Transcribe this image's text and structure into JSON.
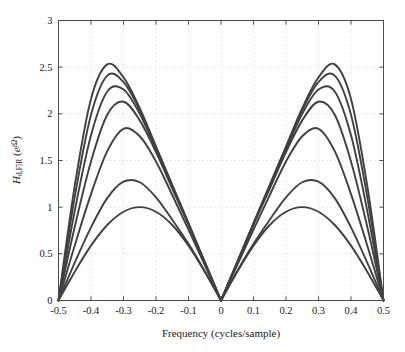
{
  "chart_data": {
    "type": "line",
    "title": "",
    "xlabel": "Frequency (cycles/sample)",
    "ylabel": "H_d,FIR (e^{jΩ})",
    "ylabel_parts": {
      "main": "H",
      "sub": "d,FIR",
      "paren_open": " (",
      "base": "e",
      "exp": "jΩ",
      "paren_close": ")"
    },
    "xlim": [
      -0.5,
      0.5
    ],
    "ylim": [
      0,
      3
    ],
    "xticks": [
      -0.5,
      -0.4,
      -0.3,
      -0.2,
      -0.1,
      0,
      0.1,
      0.2,
      0.3,
      0.4,
      0.5
    ],
    "xticklabels": [
      "-0.5",
      "-0.4",
      "-0.3",
      "-0.2",
      "-0.1",
      "0",
      "0.1",
      "0.2",
      "0.3",
      "0.4",
      "0.5"
    ],
    "yticks": [
      0,
      0.5,
      1,
      1.5,
      2,
      2.5,
      3
    ],
    "yticklabels": [
      "0",
      "0.5",
      "1",
      "1.5",
      "2",
      "2.5",
      "3"
    ],
    "grid": true,
    "grid_style": "dotted",
    "grid_color": "#bfbfbf",
    "legend": "none",
    "line_color": "#404040",
    "axis_color": "#4d4d4d",
    "background": "#ffffff",
    "series": [
      {
        "name": "N = 1",
        "peak_x": 0.25,
        "peak_y": 1.0,
        "values_x": [
          -0.5,
          -0.45,
          -0.4,
          -0.35,
          -0.3,
          -0.25,
          -0.2,
          -0.15,
          -0.1,
          -0.05,
          0,
          0.05,
          0.1,
          0.15,
          0.2,
          0.25,
          0.3,
          0.35,
          0.4,
          0.45,
          0.5
        ],
        "values_y": [
          0.0,
          0.309,
          0.588,
          0.809,
          0.951,
          1.0,
          0.951,
          0.809,
          0.588,
          0.309,
          0.0,
          0.309,
          0.588,
          0.809,
          0.951,
          1.0,
          0.951,
          0.809,
          0.588,
          0.309,
          0.0
        ]
      },
      {
        "name": "N = 2",
        "peak_x": 0.283,
        "peak_y": 1.29,
        "values_x": [
          -0.5,
          -0.45,
          -0.4,
          -0.35,
          -0.3,
          -0.25,
          -0.2,
          -0.15,
          -0.1,
          -0.05,
          0,
          0.05,
          0.1,
          0.15,
          0.2,
          0.25,
          0.3,
          0.35,
          0.4,
          0.45,
          0.5
        ],
        "values_y": [
          0.0,
          0.406,
          0.784,
          1.097,
          1.273,
          1.267,
          1.106,
          0.866,
          0.607,
          0.315,
          0.0,
          0.315,
          0.607,
          0.866,
          1.106,
          1.267,
          1.273,
          1.097,
          0.784,
          0.406,
          0.0
        ]
      },
      {
        "name": "N = 3",
        "peak_x": 0.34,
        "peak_y": 1.9,
        "values_x": [
          -0.5,
          -0.45,
          -0.4,
          -0.35,
          -0.3,
          -0.25,
          -0.2,
          -0.15,
          -0.1,
          -0.05,
          0,
          0.05,
          0.1,
          0.15,
          0.2,
          0.25,
          0.3,
          0.35,
          0.4,
          0.45,
          0.5
        ],
        "values_y": [
          0.0,
          0.59,
          1.14,
          1.6,
          1.84,
          1.76,
          1.49,
          1.13,
          0.76,
          0.38,
          0.0,
          0.38,
          0.76,
          1.13,
          1.49,
          1.76,
          1.84,
          1.6,
          1.14,
          0.59,
          0.0
        ]
      },
      {
        "name": "N = 4",
        "peak_x": 0.385,
        "peak_y": 2.21,
        "values_x": [
          -0.5,
          -0.45,
          -0.4,
          -0.35,
          -0.3,
          -0.25,
          -0.2,
          -0.15,
          -0.1,
          -0.05,
          0,
          0.05,
          0.1,
          0.15,
          0.2,
          0.25,
          0.3,
          0.35,
          0.4,
          0.45,
          0.5
        ],
        "values_y": [
          0.0,
          0.79,
          1.49,
          1.99,
          2.13,
          1.93,
          1.59,
          1.2,
          0.81,
          0.4,
          0.0,
          0.4,
          0.81,
          1.2,
          1.59,
          1.93,
          2.13,
          1.99,
          1.49,
          0.79,
          0.0
        ]
      },
      {
        "name": "N = 5",
        "peak_x": 0.405,
        "peak_y": 2.41,
        "values_x": [
          -0.5,
          -0.45,
          -0.4,
          -0.35,
          -0.3,
          -0.25,
          -0.2,
          -0.15,
          -0.1,
          -0.05,
          0,
          0.05,
          0.1,
          0.15,
          0.2,
          0.25,
          0.3,
          0.35,
          0.4,
          0.45,
          0.5
        ],
        "values_y": [
          0.0,
          0.96,
          1.77,
          2.24,
          2.26,
          2.0,
          1.62,
          1.22,
          0.82,
          0.41,
          0.0,
          0.41,
          0.82,
          1.22,
          1.62,
          2.0,
          2.26,
          2.24,
          1.77,
          0.96,
          0.0
        ]
      },
      {
        "name": "N = 6",
        "peak_x": 0.42,
        "peak_y": 2.54,
        "values_x": [
          -0.5,
          -0.45,
          -0.4,
          -0.35,
          -0.3,
          -0.25,
          -0.2,
          -0.15,
          -0.1,
          -0.05,
          0,
          0.05,
          0.1,
          0.15,
          0.2,
          0.25,
          0.3,
          0.35,
          0.4,
          0.45,
          0.5
        ],
        "values_y": [
          0.0,
          1.11,
          1.99,
          2.41,
          2.34,
          2.04,
          1.64,
          1.23,
          0.82,
          0.41,
          0.0,
          0.41,
          0.82,
          1.23,
          1.64,
          2.04,
          2.34,
          2.41,
          1.99,
          1.11,
          0.0
        ]
      },
      {
        "name": "N = 7",
        "peak_x": 0.43,
        "peak_y": 2.65,
        "values_x": [
          -0.5,
          -0.45,
          -0.4,
          -0.35,
          -0.3,
          -0.25,
          -0.2,
          -0.15,
          -0.1,
          -0.05,
          0,
          0.05,
          0.1,
          0.15,
          0.2,
          0.25,
          0.3,
          0.35,
          0.4,
          0.45,
          0.5
        ],
        "values_y": [
          0.0,
          1.23,
          2.16,
          2.53,
          2.39,
          2.06,
          1.65,
          1.24,
          0.83,
          0.41,
          0.0,
          0.41,
          0.83,
          1.24,
          1.65,
          2.06,
          2.39,
          2.53,
          2.16,
          1.23,
          0.0
        ]
      }
    ]
  }
}
